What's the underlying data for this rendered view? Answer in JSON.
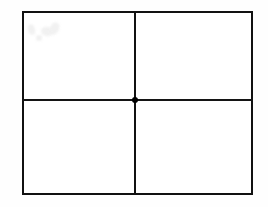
{
  "figure": {
    "type": "quadrant-diagram",
    "title": "",
    "caption": "",
    "background_color": "#fefefe",
    "page_color": "#ffffff",
    "stroke_color": "#111111",
    "width_px": 268,
    "height_px": 207
  },
  "rectangle": {
    "name": "outer-rectangle",
    "label": "",
    "left_px": 22,
    "top_px": 11,
    "right_px": 253,
    "bottom_px": 195,
    "width_px": 231,
    "height_px": 184,
    "stroke_width_px": 2.5,
    "stroke_color": "#111111",
    "fill_color": "#ffffff"
  },
  "dividers": [
    {
      "name": "vertical-divider",
      "orientation": "vertical",
      "position_px": 135,
      "stroke_width_px": 2.4,
      "stroke_color": "#111111",
      "label": ""
    },
    {
      "name": "horizontal-divider",
      "orientation": "horizontal",
      "position_px": 100,
      "stroke_width_px": 2.4,
      "stroke_color": "#141414",
      "label": ""
    }
  ],
  "center_point": {
    "name": "center-point",
    "label": "",
    "x_px": 135,
    "y_px": 100,
    "diameter_px": 6.5,
    "color": "#000000",
    "shape": "filled-circle"
  },
  "quadrants": [
    {
      "name": "top-left",
      "label": "",
      "value": ""
    },
    {
      "name": "top-right",
      "label": "",
      "value": ""
    },
    {
      "name": "bottom-left",
      "label": "",
      "value": ""
    },
    {
      "name": "bottom-right",
      "label": "",
      "value": ""
    }
  ],
  "artifacts": {
    "description": "faint light-gray scan smudges in upper-left quadrant",
    "color": "#f1f1f1",
    "count": 4
  }
}
